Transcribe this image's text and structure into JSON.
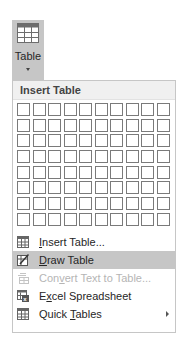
{
  "ribbon_button": {
    "label": "Table",
    "icon": "table-icon"
  },
  "dropdown": {
    "header": "Insert Table",
    "grid": {
      "columns": 10,
      "rows": 8
    },
    "items": [
      {
        "pre": "",
        "accel": "I",
        "post": "nsert Table...",
        "icon": "insert-table-icon",
        "state": "normal"
      },
      {
        "pre": "",
        "accel": "D",
        "post": "raw Table",
        "icon": "draw-table-icon",
        "state": "highlight"
      },
      {
        "pre": "Con",
        "accel": "v",
        "post": "ert Text to Table...",
        "icon": "convert-text-icon",
        "state": "disabled"
      },
      {
        "pre": "E",
        "accel": "x",
        "post": "cel Spreadsheet",
        "icon": "excel-spreadsheet-icon",
        "state": "normal"
      },
      {
        "pre": "Quick ",
        "accel": "T",
        "post": "ables",
        "icon": "quick-tables-icon",
        "state": "normal",
        "submenu": true
      }
    ]
  }
}
